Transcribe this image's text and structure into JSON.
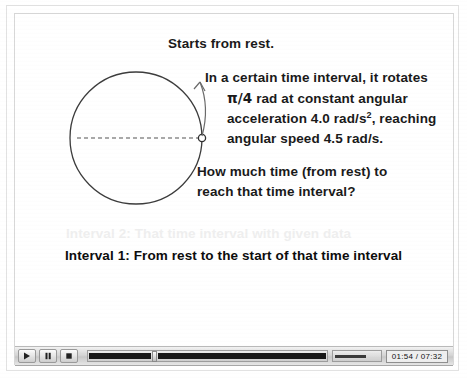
{
  "slide": {
    "starts_line": "Starts from rest.",
    "paragraph": {
      "line1": "In a certain time interval, it rotates",
      "line2_pi": "π/4",
      "line2_rest": " rad at constant angular",
      "line3_a": "acceleration 4.0 rad/s",
      "line3_sup": "2",
      "line3_b": ", reaching",
      "line4": "angular speed 4.5 rad/s."
    },
    "question": {
      "line1": "How much time (from rest) to",
      "line2": "reach that time interval?"
    },
    "interval2": "Interval 2: That time interval with given data",
    "interval1": "Interval 1: From rest to the start of that time interval",
    "colors": {
      "interval2_faded": "#efefef",
      "interval1_text": "#0d0d0d",
      "diagram_stroke": "#3a3a3a"
    }
  },
  "diagram": {
    "name": "rotating-disk-diagram",
    "circle_label": "",
    "dot_label": "",
    "radius_line_style": "dashed",
    "arrow_direction": "counterclockwise"
  },
  "player": {
    "play_label": "▶",
    "pause_label": "❙❙",
    "stop_label": "■",
    "time_display": "01:54 / 07:32",
    "seek_percent": 26,
    "volume_percent": 70
  }
}
